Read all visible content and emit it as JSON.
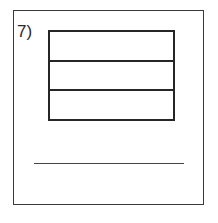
{
  "worksheet": {
    "problem_number": "7)",
    "figure": {
      "shape": "rectangle",
      "total_parts": 3,
      "shaded_parts": 0,
      "parts": [
        {
          "shaded": false
        },
        {
          "shaded": false
        },
        {
          "shaded": false
        }
      ]
    },
    "answer": ""
  }
}
